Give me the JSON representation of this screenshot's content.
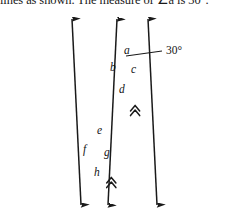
{
  "problem": {
    "text": "lines as shown. The measure of ∠a is 30°."
  },
  "figure": {
    "stroke_color": "#1a1a1a",
    "background": "#ffffff",
    "angle_annotation": {
      "label": "30°",
      "x": 166,
      "y": 52
    },
    "angle_labels": [
      {
        "id": "a",
        "text": "a",
        "x": 124,
        "y": 45
      },
      {
        "id": "b",
        "text": "b",
        "x": 110,
        "y": 62
      },
      {
        "id": "c",
        "text": "c",
        "x": 131,
        "y": 64
      },
      {
        "id": "d",
        "text": "d",
        "x": 119,
        "y": 84
      },
      {
        "id": "e",
        "text": "e",
        "x": 97,
        "y": 125
      },
      {
        "id": "f",
        "text": "f",
        "x": 83,
        "y": 144
      },
      {
        "id": "g",
        "text": "g",
        "x": 104,
        "y": 147
      },
      {
        "id": "h",
        "text": "h",
        "x": 94,
        "y": 167
      }
    ],
    "lines": [
      {
        "id": "left-transversal",
        "x1": 72,
        "y1": 16,
        "x2": 81,
        "y2": 208,
        "arrow_start": true,
        "arrow_end": true,
        "ticks": 0
      },
      {
        "id": "middle-parallel",
        "x1": 117,
        "y1": 16,
        "x2": 108,
        "y2": 208,
        "arrow_start": true,
        "arrow_end": true,
        "ticks": 2
      },
      {
        "id": "right-parallel",
        "x1": 148,
        "y1": 16,
        "x2": 157,
        "y2": 208,
        "arrow_start": true,
        "arrow_end": true,
        "ticks": 2
      }
    ],
    "intersections": [
      {
        "id": "upper",
        "x": 122,
        "y": 59
      },
      {
        "id": "lower",
        "x": 96,
        "y": 141
      }
    ]
  }
}
